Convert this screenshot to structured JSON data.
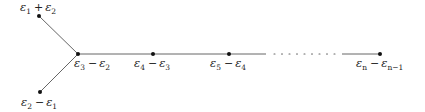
{
  "diagram": {
    "type": "Dynkin-style diagram (D_n root system)",
    "nodes": [
      {
        "id": "n1",
        "x": 39,
        "y": 16,
        "label": {
          "a": "ε",
          "a_sub": "1",
          "op": "+",
          "b": "ε",
          "b_sub": "2"
        },
        "label_pos": "above"
      },
      {
        "id": "n2",
        "x": 40,
        "y": 92,
        "label": {
          "a": "ε",
          "a_sub": "2",
          "op": "−",
          "b": "ε",
          "b_sub": "1"
        },
        "label_pos": "below"
      },
      {
        "id": "n3",
        "x": 78,
        "y": 54,
        "label": {
          "a": "ε",
          "a_sub": "3",
          "op": "−",
          "b": "ε",
          "b_sub": "2"
        },
        "label_pos": "below"
      },
      {
        "id": "n4",
        "x": 153,
        "y": 54,
        "label": {
          "a": "ε",
          "a_sub": "4",
          "op": "−",
          "b": "ε",
          "b_sub": "3"
        },
        "label_pos": "below"
      },
      {
        "id": "n5",
        "x": 229,
        "y": 54,
        "label": {
          "a": "ε",
          "a_sub": "5",
          "op": "−",
          "b": "ε",
          "b_sub": "4"
        },
        "label_pos": "below"
      },
      {
        "id": "n6",
        "x": 380,
        "y": 54,
        "label": {
          "a": "ε",
          "a_sub": "n",
          "op": "−",
          "b": "ε",
          "b_sub": "n−1"
        },
        "label_pos": "below"
      }
    ],
    "edges": [
      {
        "from": "n1",
        "to": "n3",
        "style": "solid"
      },
      {
        "from": "n2",
        "to": "n3",
        "style": "solid"
      },
      {
        "from": "n3",
        "to": "n4",
        "style": "solid"
      },
      {
        "from": "n4",
        "to": "n5",
        "style": "solid"
      },
      {
        "from": "n5",
        "to": "n6",
        "style": "solid-dotted-solid",
        "dotted_range": [
          272,
          338
        ]
      }
    ],
    "colors": {
      "line": "#555555",
      "node": "#111111",
      "text": "#222222"
    }
  }
}
